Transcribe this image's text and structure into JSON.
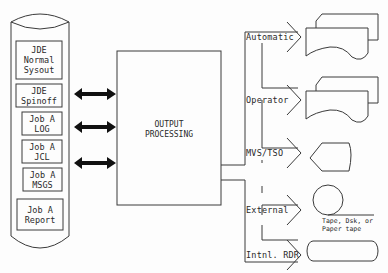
{
  "spool": {
    "items": [
      {
        "label": "JDE\nNormal\nSysout"
      },
      {
        "label": "JDE\nSpinoff"
      },
      {
        "label": "Job A\nLOG"
      },
      {
        "label": "Job A\nJCL"
      },
      {
        "label": "Job A\nMSGS"
      },
      {
        "label": "Job A\nReport"
      }
    ]
  },
  "processor": {
    "title": "OUTPUT\nPROCESSING"
  },
  "routes": [
    {
      "label": "Automatic",
      "device": "printer"
    },
    {
      "label": "Operator",
      "device": "printer"
    },
    {
      "label": "MVS/TSO",
      "device": "display"
    },
    {
      "label": "External",
      "device": "tape-disk"
    },
    {
      "label": "Intnl. RDR",
      "device": "internal-reader"
    }
  ],
  "captions": {
    "external_media": "Tape, Dsk, or\nPaper tape"
  },
  "colors": {
    "line": "#3a3a3a",
    "arrow_fill": "#111111",
    "background": "#fdfdfd"
  }
}
